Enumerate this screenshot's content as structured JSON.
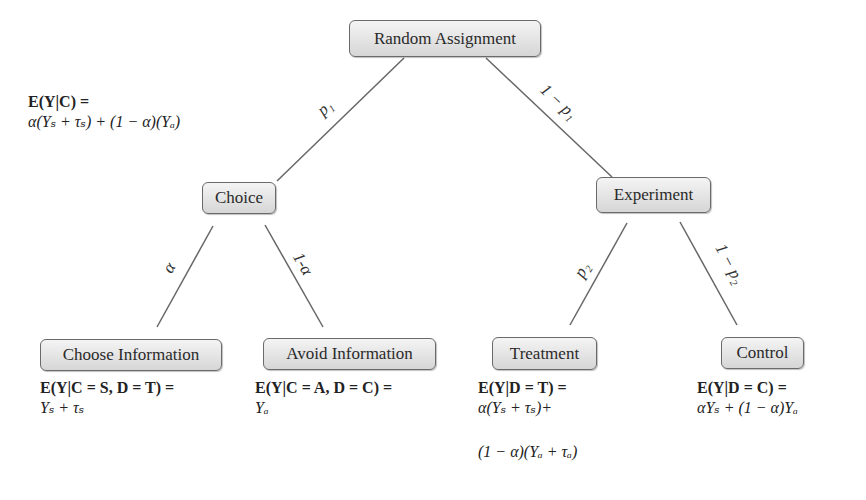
{
  "diagram": {
    "type": "tree",
    "nodes": {
      "root": {
        "label": "Random Assignment"
      },
      "choice": {
        "label": "Choice"
      },
      "experiment": {
        "label": "Experiment"
      },
      "choose_info": {
        "label": "Choose Information"
      },
      "avoid_info": {
        "label": "Avoid Information"
      },
      "treatment": {
        "label": "Treatment"
      },
      "control": {
        "label": "Control"
      }
    },
    "edges": {
      "root_choice": {
        "label": "p₁",
        "from": "Random Assignment",
        "to": "Choice"
      },
      "root_experiment": {
        "label": "1 − p₁",
        "from": "Random Assignment",
        "to": "Experiment"
      },
      "choice_choose": {
        "label": "α",
        "from": "Choice",
        "to": "Choose Information"
      },
      "choice_avoid": {
        "label": "1-α",
        "from": "Choice",
        "to": "Avoid Information"
      },
      "experiment_treatment": {
        "label": "p₂",
        "from": "Experiment",
        "to": "Treatment"
      },
      "experiment_control": {
        "label": "1 − p₂",
        "from": "Experiment",
        "to": "Control"
      }
    },
    "formulas": {
      "choice": {
        "line1": "E(Y|C) =",
        "line2": "α(Yₛ + τₛ) + (1 − α)(Yₐ)"
      },
      "choose_info": {
        "line1": "E(Y|C = S, D = T) =",
        "line2": "Yₛ + τₛ"
      },
      "avoid_info": {
        "line1": "E(Y|C = A, D = C) =",
        "line2": "Yₐ"
      },
      "treatment": {
        "line1": "E(Y|D = T) =",
        "line2": "α(Yₛ + τₛ)+",
        "line3": "(1 − α)(Yₐ + τₐ)"
      },
      "control": {
        "line1": "E(Y|D = C) =",
        "line2": "αYₛ + (1 − α)Yₐ"
      }
    },
    "colors": {
      "node_border": "#6a6a6a",
      "node_fill_top": "#f4f4f4",
      "node_fill_bottom": "#d6d6d6",
      "edge": "#666666",
      "text": "#222222"
    }
  }
}
